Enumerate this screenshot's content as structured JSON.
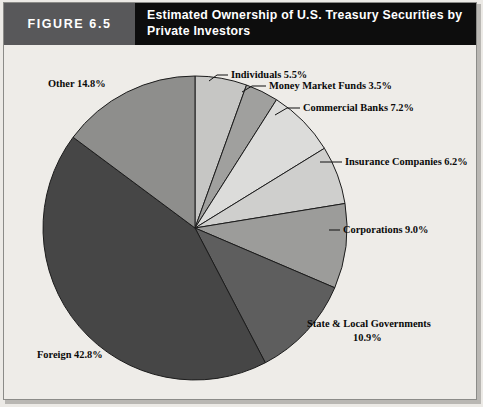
{
  "figure": {
    "number_label": "FIGURE 6.5",
    "title_line1": "Estimated Ownership of U.S. Treasury Securities by",
    "title_line2": "Private Investors",
    "title_full": "Estimated Ownership of U.S. Treasury Securities by Private Investors"
  },
  "chart_data": {
    "type": "pie",
    "title": "Estimated Ownership of U.S. Treasury Securities by Private Investors",
    "unit": "percent",
    "legend_position": "none",
    "labels_inline": true,
    "total": 99.9,
    "categories": [
      "Individuals",
      "Money Market Funds",
      "Commercial Banks",
      "Insurance Companies",
      "Corporations",
      "State & Local Governments",
      "Foreign",
      "Other"
    ],
    "values": [
      5.5,
      3.5,
      7.2,
      6.2,
      9.0,
      10.9,
      42.8,
      14.8
    ],
    "colors": [
      "#c6c6c4",
      "#a0a09e",
      "#dcdcda",
      "#cfcfcd",
      "#9c9c9a",
      "#5e5e5e",
      "#464646",
      "#8e8e8c"
    ],
    "slices": [
      {
        "name": "Individuals",
        "value": 5.5,
        "value_text": "5.5%",
        "label_text": "Individuals  5.5%",
        "color": "#c6c6c4"
      },
      {
        "name": "Money Market Funds",
        "value": 3.5,
        "value_text": "3.5%",
        "label_text": "Money Market Funds  3.5%",
        "color": "#a0a09e"
      },
      {
        "name": "Commercial Banks",
        "value": 7.2,
        "value_text": "7.2%",
        "label_text": "Commercial Banks  7.2%",
        "color": "#dcdcda"
      },
      {
        "name": "Insurance Companies",
        "value": 6.2,
        "value_text": "6.2%",
        "label_text": "Insurance Companies  6.2%",
        "color": "#cfcfcd"
      },
      {
        "name": "Corporations",
        "value": 9.0,
        "value_text": "9.0%",
        "label_text": "Corporations  9.0%",
        "color": "#9c9c9a"
      },
      {
        "name": "State & Local Governments",
        "value": 10.9,
        "value_text": "10.9%",
        "label_line1": "State & Local Governments",
        "label_line2": "10.9%",
        "color": "#5e5e5e"
      },
      {
        "name": "Foreign",
        "value": 42.8,
        "value_text": "42.8%",
        "label_text": "Foreign  42.8%",
        "color": "#464646"
      },
      {
        "name": "Other",
        "value": 14.8,
        "value_text": "14.8%",
        "label_text": "Other  14.8%",
        "color": "#8e8e8c"
      }
    ]
  },
  "theme": {
    "page_background": "#eceae6",
    "header_bar": "#0d0d0d",
    "figure_tag_background": "#58585a",
    "header_text": "#ffffff",
    "slice_outline": "#1c1c1c",
    "label_text": "#0a0a0a"
  }
}
